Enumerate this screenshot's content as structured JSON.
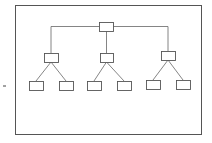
{
  "diagram": {
    "type": "tree",
    "frame": {
      "x": 15,
      "y": 5,
      "w": 187,
      "h": 130
    },
    "stroke": "#555555",
    "fill": "#ffffff",
    "node_size": {
      "w": 14,
      "h": 9
    },
    "nodes": [
      {
        "id": "root",
        "label": "",
        "x": 99,
        "y": 22
      },
      {
        "id": "mid-left",
        "label": "",
        "x": 44,
        "y": 53
      },
      {
        "id": "mid-center",
        "label": "",
        "x": 100,
        "y": 53
      },
      {
        "id": "mid-right",
        "label": "",
        "x": 161,
        "y": 51
      },
      {
        "id": "leaf-1",
        "label": "",
        "x": 29,
        "y": 81
      },
      {
        "id": "leaf-2",
        "label": "",
        "x": 59,
        "y": 81
      },
      {
        "id": "leaf-3",
        "label": "",
        "x": 87,
        "y": 81
      },
      {
        "id": "leaf-4",
        "label": "",
        "x": 117,
        "y": 81
      },
      {
        "id": "leaf-5",
        "label": "",
        "x": 146,
        "y": 80
      },
      {
        "id": "leaf-6",
        "label": "",
        "x": 176,
        "y": 80
      }
    ],
    "edges": [
      [
        "root",
        "mid-left"
      ],
      [
        "root",
        "mid-center"
      ],
      [
        "root",
        "mid-right"
      ],
      [
        "mid-left",
        "leaf-1"
      ],
      [
        "mid-left",
        "leaf-2"
      ],
      [
        "mid-center",
        "leaf-3"
      ],
      [
        "mid-center",
        "leaf-4"
      ],
      [
        "mid-right",
        "leaf-5"
      ],
      [
        "mid-right",
        "leaf-6"
      ]
    ],
    "side_mark": {
      "x": 3,
      "y": 86,
      "w": 3
    }
  }
}
